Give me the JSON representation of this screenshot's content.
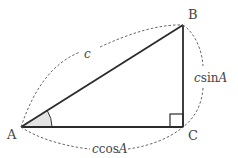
{
  "diagram": {
    "type": "right-triangle",
    "vertices": {
      "A": {
        "label": "A",
        "x": 21,
        "y": 127
      },
      "B": {
        "label": "B",
        "x": 183,
        "y": 25
      },
      "C": {
        "label": "C",
        "x": 183,
        "y": 127
      }
    },
    "sides": {
      "hypotenuse": {
        "label": "c",
        "from": "A",
        "to": "B"
      },
      "opposite": {
        "label_prefix": "csin",
        "label_var": "A",
        "from": "B",
        "to": "C"
      },
      "adjacent": {
        "label_prefix": "ccos",
        "label_var": "A",
        "from": "A",
        "to": "C"
      }
    },
    "angle_marker": {
      "vertex": "A",
      "fill": "#e4e4e4"
    },
    "right_angle": {
      "vertex": "C"
    },
    "colors": {
      "line": "#2b2b2b",
      "dashed": "#555555",
      "label": "#444444"
    }
  }
}
